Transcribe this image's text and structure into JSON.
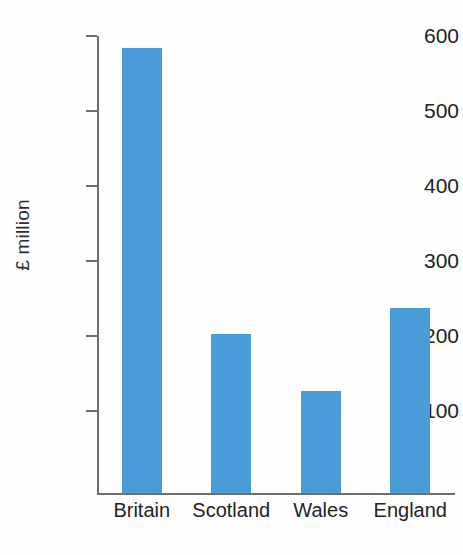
{
  "chart_data": {
    "type": "bar",
    "title": "",
    "subtitle": "",
    "xlabel": "",
    "ylabel": "£ million",
    "categories": [
      "Britain",
      "Scotland",
      "Wales",
      "England"
    ],
    "values": [
      584,
      203,
      127,
      238
    ],
    "series": [
      {
        "name": "£ million",
        "values": [
          584,
          203,
          127,
          238
        ]
      }
    ],
    "ylim": [
      0,
      620
    ],
    "yticks": [
      100,
      200,
      300,
      400,
      500,
      600
    ],
    "ytick_labels": [
      "100",
      "200",
      "300",
      "400",
      "500",
      "600"
    ],
    "grid": false,
    "legend": false,
    "legend_position": "none",
    "bar_color": "#4a9cd9",
    "axis_color": "#6e6e6e",
    "background_color": "#fefefe",
    "annotations": []
  }
}
